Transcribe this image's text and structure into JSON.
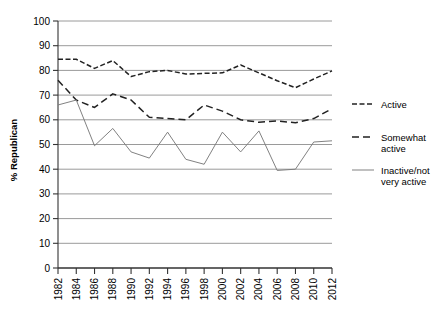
{
  "chart_data": {
    "type": "line",
    "title": "",
    "xlabel": "",
    "ylabel": "% Republican",
    "ylim": [
      0,
      100
    ],
    "yticks": [
      0,
      10,
      20,
      30,
      40,
      50,
      60,
      70,
      80,
      90,
      100
    ],
    "grid": true,
    "legend_position": "right",
    "x": [
      1982,
      1984,
      1986,
      1988,
      1990,
      1992,
      1994,
      1996,
      1998,
      2000,
      2002,
      2004,
      2006,
      2008,
      2010,
      2012
    ],
    "categories": [
      "1982",
      "1984",
      "1986",
      "1988",
      "1990",
      "1992",
      "1994",
      "1996",
      "1998",
      "2000",
      "2002",
      "2004",
      "2006",
      "2008",
      "2010",
      "2012"
    ],
    "series": [
      {
        "name": "Active",
        "style": "fine-dashed",
        "color": "#222222",
        "values": [
          84.5,
          84.5,
          80.8,
          84.0,
          77.5,
          79.5,
          80.0,
          78.5,
          78.8,
          79.0,
          82.2,
          79.0,
          75.8,
          73.0,
          76.5,
          79.8
        ]
      },
      {
        "name": "Somewhat active",
        "style": "long-dashed",
        "color": "#222222",
        "values": [
          76.0,
          68.0,
          65.0,
          70.5,
          68.0,
          61.0,
          60.5,
          60.0,
          66.0,
          63.5,
          60.0,
          59.0,
          59.5,
          58.8,
          60.5,
          64.5
        ]
      },
      {
        "name": "Inactive/not very active",
        "style": "solid",
        "color": "#7a7a7a",
        "values": [
          66.0,
          68.0,
          49.5,
          56.5,
          47.0,
          44.5,
          55.0,
          44.0,
          42.0,
          55.0,
          47.0,
          55.5,
          39.5,
          40.0,
          51.0,
          51.5
        ]
      }
    ]
  },
  "legend": {
    "items": [
      {
        "label": "Active",
        "label_line2": ""
      },
      {
        "label": "Somewhat",
        "label_line2": "active"
      },
      {
        "label": "Inactive/not",
        "label_line2": "very active"
      }
    ]
  },
  "axes": {
    "y_label": "% Republican",
    "y_ticks": [
      "100",
      "90",
      "80",
      "70",
      "60",
      "50",
      "40",
      "30",
      "20",
      "10",
      "0"
    ],
    "x_ticks": [
      "1982",
      "1984",
      "1986",
      "1988",
      "1990",
      "1992",
      "1994",
      "1996",
      "1998",
      "2000",
      "2002",
      "2004",
      "2006",
      "2008",
      "2010",
      "2012"
    ]
  }
}
